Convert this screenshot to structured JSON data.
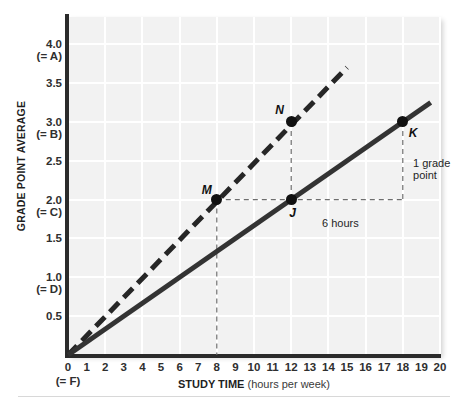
{
  "chart_data": {
    "type": "line",
    "title": "",
    "xlabel": "STUDY TIME (hours per week)",
    "xlabel_bold": "STUDY TIME",
    "xlabel_light": "(hours per week)",
    "ylabel": "GRADE POINT AVERAGE",
    "xlim": [
      0,
      20
    ],
    "ylim": [
      0,
      4.35
    ],
    "grid": true,
    "legend": "none",
    "x_ticks": [
      "0",
      "1",
      "2",
      "3",
      "4",
      "5",
      "6",
      "7",
      "8",
      "9",
      "10",
      "11",
      "12",
      "13",
      "14",
      "15",
      "16",
      "17",
      "18",
      "19",
      "20"
    ],
    "x_tick_values": [
      0,
      1,
      2,
      3,
      4,
      5,
      6,
      7,
      8,
      9,
      10,
      11,
      12,
      13,
      14,
      15,
      16,
      17,
      18,
      19,
      20
    ],
    "x_origin_sublabel": "(= F)",
    "y_ticks": [
      {
        "value": 4.0,
        "label": "4.0",
        "sublabel": "(= A)"
      },
      {
        "value": 3.5,
        "label": "3.5",
        "sublabel": ""
      },
      {
        "value": 3.0,
        "label": "3.0",
        "sublabel": "(= B)"
      },
      {
        "value": 2.5,
        "label": "2.5",
        "sublabel": ""
      },
      {
        "value": 2.0,
        "label": "2.0",
        "sublabel": "(= C)"
      },
      {
        "value": 1.5,
        "label": "1.5",
        "sublabel": ""
      },
      {
        "value": 1.0,
        "label": "1.0",
        "sublabel": "(= D)"
      },
      {
        "value": 0.5,
        "label": "0.5",
        "sublabel": ""
      },
      {
        "value": 0.0,
        "label": "0",
        "sublabel": "(= F)"
      }
    ],
    "series": [
      {
        "name": "steeper-dashed-line",
        "style": "dashed",
        "color": "#262626",
        "x": [
          0,
          15
        ],
        "y": [
          0,
          3.7
        ],
        "slope": 0.2467
      },
      {
        "name": "shallower-solid-line",
        "style": "solid",
        "color": "#333333",
        "x": [
          0,
          19.5
        ],
        "y": [
          0,
          3.25
        ],
        "slope": 0.1667
      }
    ],
    "points": [
      {
        "id": "M",
        "label": "M",
        "x": 8,
        "y": 2.0,
        "on_series": "steeper-dashed-line"
      },
      {
        "id": "N",
        "label": "N",
        "x": 12,
        "y": 3.0,
        "on_series": "steeper-dashed-line"
      },
      {
        "id": "J",
        "label": "J",
        "x": 12,
        "y": 2.0,
        "on_series": "shallower-solid-line"
      },
      {
        "id": "K",
        "label": "K",
        "x": 18,
        "y": 3.0,
        "on_series": "shallower-solid-line"
      }
    ],
    "annotations": [
      {
        "id": "six-hours",
        "text": "6 hours",
        "x": 15,
        "y": 1.78
      },
      {
        "id": "one-grade-point",
        "text_line1": "1 grade",
        "text_line2": "point",
        "x": 18.55,
        "y": 2.55
      }
    ],
    "guide_lines": [
      {
        "id": "m-vertical-drop",
        "from": [
          8,
          2.0
        ],
        "to": [
          8,
          0.0
        ],
        "style": "dashed"
      },
      {
        "id": "n-vertical-drop",
        "from": [
          12,
          3.0
        ],
        "to": [
          12,
          2.0
        ],
        "style": "dashed"
      },
      {
        "id": "k-vertical-drop",
        "from": [
          18,
          3.0
        ],
        "to": [
          18,
          2.0
        ],
        "style": "dashed"
      },
      {
        "id": "m-to-k-horizontal",
        "from": [
          8,
          2.0
        ],
        "to": [
          18,
          2.0
        ],
        "style": "dashed"
      }
    ]
  }
}
